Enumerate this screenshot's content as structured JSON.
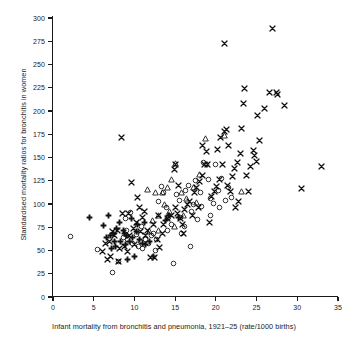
{
  "chart_data": {
    "type": "scatter",
    "title": "",
    "xlabel": "Infant mortality from bronchitis and pneumonia, 1921–25 (rate/1000 births)",
    "ylabel": "Standardised mortality ratios for bronchitis in women",
    "xlim": [
      0,
      35
    ],
    "ylim": [
      0,
      300
    ],
    "xticks": [
      0,
      5,
      10,
      15,
      20,
      25,
      30,
      35
    ],
    "yticks": [
      0,
      25,
      50,
      75,
      100,
      125,
      150,
      175,
      200,
      225,
      250,
      275,
      300
    ],
    "grid": false,
    "legend": "none",
    "marker_color": "#111111",
    "background": "#ffffff",
    "series": [
      {
        "name": "cross",
        "marker": "x",
        "points": [
          [
            8.4,
            172
          ],
          [
            9.6,
            123
          ],
          [
            10.4,
            107
          ],
          [
            10.6,
            96
          ],
          [
            11.2,
            92
          ],
          [
            11.0,
            86
          ],
          [
            10.3,
            80
          ],
          [
            9.3,
            90
          ],
          [
            8.5,
            90
          ],
          [
            7.9,
            72
          ],
          [
            7.3,
            70
          ],
          [
            6.9,
            60
          ],
          [
            6.4,
            58
          ],
          [
            6.1,
            49
          ],
          [
            7.0,
            44
          ],
          [
            6.7,
            40
          ],
          [
            8.1,
            38
          ],
          [
            8.8,
            54
          ],
          [
            9.4,
            66
          ],
          [
            9.9,
            74
          ],
          [
            10.8,
            70
          ],
          [
            11.6,
            72
          ],
          [
            12.0,
            43
          ],
          [
            12.5,
            42
          ],
          [
            12.8,
            62
          ],
          [
            13.1,
            53
          ],
          [
            13.6,
            78
          ],
          [
            14.1,
            84
          ],
          [
            14.6,
            88
          ],
          [
            14.9,
            137
          ],
          [
            15.1,
            143
          ],
          [
            15.4,
            120
          ],
          [
            15.0,
            96
          ],
          [
            15.3,
            90
          ],
          [
            15.6,
            84
          ],
          [
            15.9,
            78
          ],
          [
            16.2,
            94
          ],
          [
            16.5,
            99
          ],
          [
            16.8,
            103
          ],
          [
            17.1,
            88
          ],
          [
            17.4,
            112
          ],
          [
            17.6,
            118
          ],
          [
            18.0,
            124
          ],
          [
            18.3,
            131
          ],
          [
            18.6,
            142
          ],
          [
            18.4,
            163
          ],
          [
            18.9,
            156
          ],
          [
            19.2,
            80
          ],
          [
            19.5,
            108
          ],
          [
            19.8,
            113
          ],
          [
            20.1,
            119
          ],
          [
            20.4,
            126
          ],
          [
            20.2,
            159
          ],
          [
            20.6,
            172
          ],
          [
            21.0,
            178
          ],
          [
            21.3,
            180
          ],
          [
            21.1,
            273
          ],
          [
            21.6,
            163
          ],
          [
            21.4,
            120
          ],
          [
            21.8,
            113
          ],
          [
            22.0,
            130
          ],
          [
            22.3,
            138
          ],
          [
            22.6,
            145
          ],
          [
            22.4,
            96
          ],
          [
            22.8,
            103
          ],
          [
            23.0,
            154
          ],
          [
            23.2,
            181
          ],
          [
            23.4,
            208
          ],
          [
            23.5,
            224
          ],
          [
            23.8,
            131
          ],
          [
            24.0,
            113
          ],
          [
            24.3,
            140
          ],
          [
            24.6,
            158
          ],
          [
            24.8,
            152
          ],
          [
            25.0,
            146
          ],
          [
            25.1,
            195
          ],
          [
            25.4,
            168
          ],
          [
            26.0,
            203
          ],
          [
            26.6,
            220
          ],
          [
            26.9,
            289
          ],
          [
            27.4,
            220
          ],
          [
            27.6,
            218
          ],
          [
            28.4,
            206
          ],
          [
            30.5,
            117
          ],
          [
            33.0,
            140
          ],
          [
            9.1,
            49
          ],
          [
            8.2,
            52
          ],
          [
            12.3,
            78
          ],
          [
            13.4,
            68
          ],
          [
            16.0,
            68
          ],
          [
            17.9,
            96
          ],
          [
            19.0,
            142
          ],
          [
            20.8,
            143
          ],
          [
            12.9,
            88
          ],
          [
            11.4,
            66
          ],
          [
            10.0,
            56
          ],
          [
            7.6,
            66
          ]
        ]
      },
      {
        "name": "open-circle",
        "marker": "o",
        "points": [
          [
            2.1,
            65
          ],
          [
            5.5,
            51
          ],
          [
            7.3,
            26
          ],
          [
            8.0,
            38
          ],
          [
            8.6,
            64
          ],
          [
            9.0,
            72
          ],
          [
            9.5,
            91
          ],
          [
            9.8,
            58
          ],
          [
            10.2,
            67
          ],
          [
            10.5,
            54
          ],
          [
            10.9,
            76
          ],
          [
            11.3,
            62
          ],
          [
            11.7,
            57
          ],
          [
            12.1,
            66
          ],
          [
            12.4,
            68
          ],
          [
            12.7,
            62
          ],
          [
            13.0,
            103
          ],
          [
            13.3,
            119
          ],
          [
            13.6,
            112
          ],
          [
            13.9,
            96
          ],
          [
            14.2,
            85
          ],
          [
            14.5,
            78
          ],
          [
            14.8,
            36
          ],
          [
            15.2,
            110
          ],
          [
            15.5,
            104
          ],
          [
            15.8,
            68
          ],
          [
            16.3,
            114
          ],
          [
            16.6,
            120
          ],
          [
            16.9,
            54
          ],
          [
            17.2,
            100
          ],
          [
            17.5,
            125
          ],
          [
            17.8,
            83
          ],
          [
            18.1,
            112
          ],
          [
            18.5,
            145
          ],
          [
            18.8,
            142
          ],
          [
            19.1,
            126
          ],
          [
            19.4,
            106
          ],
          [
            19.7,
            101
          ],
          [
            20.0,
            142
          ],
          [
            20.3,
            114
          ],
          [
            20.7,
            127
          ],
          [
            21.2,
            104
          ],
          [
            21.5,
            118
          ],
          [
            21.9,
            107
          ],
          [
            8.9,
            84
          ],
          [
            11.0,
            52
          ],
          [
            12.6,
            50
          ],
          [
            14.0,
            72
          ],
          [
            15.7,
            86
          ],
          [
            16.1,
            76
          ],
          [
            17.0,
            92
          ],
          [
            18.2,
            97
          ],
          [
            19.3,
            88
          ],
          [
            20.5,
            96
          ],
          [
            9.2,
            62
          ],
          [
            10.7,
            60
          ]
        ]
      },
      {
        "name": "open-triangle",
        "marker": "triangle",
        "points": [
          [
            11.6,
            116
          ],
          [
            12.6,
            112
          ],
          [
            13.4,
            112
          ],
          [
            14.0,
            118
          ],
          [
            14.6,
            126
          ],
          [
            15.1,
            144
          ],
          [
            14.3,
            92
          ],
          [
            13.0,
            88
          ],
          [
            12.2,
            82
          ],
          [
            11.9,
            70
          ],
          [
            15.8,
            112
          ],
          [
            16.4,
            106
          ],
          [
            17.3,
            118
          ],
          [
            18.0,
            132
          ],
          [
            18.7,
            170
          ],
          [
            21.0,
            174
          ],
          [
            23.2,
            113
          ],
          [
            13.7,
            100
          ],
          [
            16.0,
            88
          ],
          [
            12.9,
            72
          ],
          [
            14.9,
            76
          ],
          [
            17.6,
            102
          ]
        ]
      },
      {
        "name": "filled-plus",
        "marker": "plus",
        "points": [
          [
            4.5,
            86
          ],
          [
            6.2,
            77
          ],
          [
            6.6,
            64
          ],
          [
            7.0,
            66
          ],
          [
            7.4,
            68
          ],
          [
            7.8,
            74
          ],
          [
            8.2,
            80
          ],
          [
            8.6,
            72
          ],
          [
            9.0,
            66
          ],
          [
            9.4,
            60
          ],
          [
            9.8,
            64
          ],
          [
            10.2,
            70
          ],
          [
            10.6,
            62
          ],
          [
            11.0,
            58
          ],
          [
            11.4,
            56
          ],
          [
            11.8,
            60
          ],
          [
            9.6,
            84
          ],
          [
            8.9,
            56
          ],
          [
            8.3,
            60
          ],
          [
            7.7,
            54
          ],
          [
            7.2,
            52
          ],
          [
            12.4,
            44
          ],
          [
            14.2,
            88
          ],
          [
            15.4,
            86
          ],
          [
            6.8,
            88
          ],
          [
            10.0,
            44
          ],
          [
            9.2,
            40
          ],
          [
            13.8,
            82
          ],
          [
            7.5,
            60
          ],
          [
            8.8,
            68
          ],
          [
            10.4,
            78
          ],
          [
            11.2,
            80
          ]
        ]
      }
    ]
  }
}
